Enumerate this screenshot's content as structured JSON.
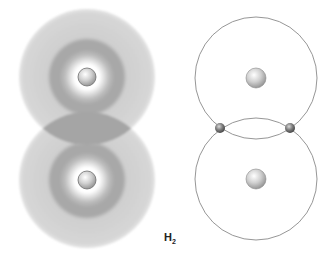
{
  "label": {
    "element": "H",
    "subscript": "2"
  },
  "colors": {
    "cloud_light": "#d4d4d4",
    "cloud_dark": "#a9a9a9",
    "orbit_line": "#8a8a8a",
    "nucleus": "#c8c8c8",
    "electron": "#7a7a7a"
  },
  "left_panel": {
    "description": "Overlapping electron clouds of two hydrogen atoms",
    "atoms": [
      {
        "cx": 87,
        "cy": 77
      },
      {
        "cx": 87,
        "cy": 180
      }
    ]
  },
  "right_panel": {
    "description": "Orbit model with shared electron pair",
    "atoms": [
      {
        "cx": 256,
        "cy": 78
      },
      {
        "cx": 256,
        "cy": 179
      }
    ],
    "shared_electrons": [
      {
        "cx": 220,
        "cy": 128
      },
      {
        "cx": 289,
        "cy": 128
      }
    ]
  }
}
